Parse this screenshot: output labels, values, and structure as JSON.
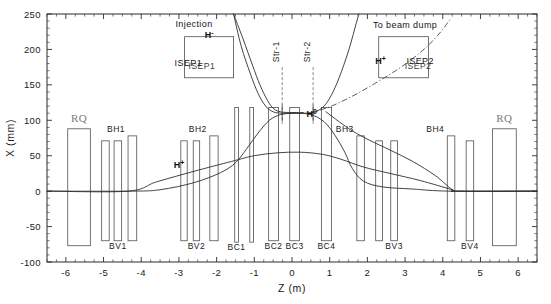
{
  "figure": {
    "background_color": "#ffffff",
    "line_color": "#2f2f2f",
    "magnet_color": "#5a5a5a",
    "rq_label_color": "#7a7a7a"
  },
  "chart_data": {
    "type": "line",
    "title": "",
    "xlabel": "Z (m)",
    "ylabel": "X (mm)",
    "xlim": [
      -6.5,
      6.5
    ],
    "ylim": [
      -100,
      250
    ],
    "xticks": [
      -6,
      -5,
      -4,
      -3,
      -2,
      -1,
      0,
      1,
      2,
      3,
      4,
      5,
      6
    ],
    "xticklabels": [
      "-6",
      "-5",
      "-4",
      "-3",
      "-2",
      "-1",
      "0",
      "1",
      "2",
      "3",
      "4",
      "5",
      "6"
    ],
    "yticks": [
      -100,
      -50,
      0,
      50,
      100,
      150,
      200,
      250
    ],
    "yticklabels": [
      "-100",
      "-50",
      "0",
      "50",
      "100",
      "150",
      "200",
      "250"
    ],
    "x_minor_interval": 0.25,
    "y_minor_interval": 10,
    "grid": false,
    "legend": false,
    "tick_direction": "in",
    "series": [
      {
        "name": "H+ circulating beam",
        "style": "solid",
        "points": [
          [
            -6.5,
            0
          ],
          [
            -4.35,
            0
          ],
          [
            -3.6,
            13
          ],
          [
            -2.6,
            28
          ],
          [
            -1.6,
            42
          ],
          [
            -1.0,
            50
          ],
          [
            -0.4,
            54
          ],
          [
            0.2,
            55
          ],
          [
            0.8,
            52
          ],
          [
            1.3,
            45
          ],
          [
            1.9,
            34
          ],
          [
            2.6,
            25
          ],
          [
            3.4,
            15
          ],
          [
            4.25,
            2
          ],
          [
            4.4,
            0
          ],
          [
            6.5,
            0
          ]
        ]
      },
      {
        "name": "H- injected beam",
        "style": "solid",
        "points": [
          [
            -1.55,
            250
          ],
          [
            -1.3,
            215
          ],
          [
            -1.05,
            178
          ],
          [
            -0.85,
            150
          ],
          [
            -0.65,
            128
          ],
          [
            -0.48,
            116
          ],
          [
            -0.3,
            112
          ],
          [
            -0.1,
            111
          ],
          [
            0.3,
            111
          ]
        ]
      },
      {
        "name": "H- stripped / foil branch",
        "style": "solid",
        "points": [
          [
            -1.55,
            250
          ],
          [
            -1.35,
            205
          ],
          [
            -1.1,
            165
          ],
          [
            -0.9,
            138
          ],
          [
            -0.7,
            120
          ],
          [
            -0.5,
            112
          ],
          [
            -0.28,
            110
          ],
          [
            0.0,
            110
          ],
          [
            0.35,
            110
          ],
          [
            0.62,
            112
          ],
          [
            0.85,
            120
          ],
          [
            1.05,
            136
          ],
          [
            1.25,
            160
          ],
          [
            1.5,
            198
          ],
          [
            1.72,
            240
          ],
          [
            1.78,
            250
          ]
        ]
      },
      {
        "name": "H0 to beam dump (dot-dash)",
        "style": "dashdot",
        "points": [
          [
            0.45,
            110
          ],
          [
            1.0,
            119
          ],
          [
            1.6,
            134
          ],
          [
            2.2,
            152
          ],
          [
            2.75,
            170
          ],
          [
            3.2,
            187
          ],
          [
            3.6,
            205
          ],
          [
            3.95,
            225
          ],
          [
            4.2,
            243
          ]
        ]
      },
      {
        "name": "secondary orbit lower branch",
        "style": "solid",
        "points": [
          [
            -6.5,
            0
          ],
          [
            -4.3,
            0
          ],
          [
            -3.5,
            2
          ],
          [
            -2.6,
            12
          ],
          [
            -1.9,
            26
          ],
          [
            -1.5,
            40
          ],
          [
            -1.2,
            60
          ],
          [
            -0.9,
            82
          ],
          [
            -0.6,
            100
          ],
          [
            -0.3,
            108
          ],
          [
            0.1,
            110
          ],
          [
            0.5,
            108
          ],
          [
            0.85,
            98
          ],
          [
            1.15,
            78
          ],
          [
            1.4,
            55
          ],
          [
            1.6,
            32
          ],
          [
            1.9,
            14
          ],
          [
            2.4,
            6
          ],
          [
            3.2,
            3
          ],
          [
            4.2,
            0
          ],
          [
            6.5,
            0
          ]
        ]
      },
      {
        "name": "extraction branch to right",
        "style": "solid",
        "points": [
          [
            0.9,
            112
          ],
          [
            1.25,
            98
          ],
          [
            1.6,
            85
          ],
          [
            2.05,
            72
          ],
          [
            2.6,
            58
          ],
          [
            3.2,
            42
          ],
          [
            3.8,
            22
          ],
          [
            4.25,
            2
          ],
          [
            4.4,
            0
          ],
          [
            6.5,
            0
          ]
        ]
      }
    ],
    "annotations": [
      {
        "text": "Injection",
        "z": -2.6,
        "x": 232
      },
      {
        "text": "H-",
        "z": -2.2,
        "x": 216
      },
      {
        "text": "ISEP1",
        "z": -2.75,
        "x": 176
      },
      {
        "text": "To beam dump",
        "z": 3.0,
        "x": 230
      },
      {
        "text": "H+",
        "z": 2.35,
        "x": 180
      },
      {
        "text": "ISEP2",
        "z": 3.4,
        "x": 180
      },
      {
        "text": "H+",
        "z": -3.0,
        "x": 33
      },
      {
        "text": "H0",
        "z": 0.52,
        "x": 105
      },
      {
        "text": "Str-1",
        "z": -0.25,
        "x": 150
      },
      {
        "text": "Str-2",
        "z": 0.55,
        "x": 160
      }
    ]
  },
  "axes": {
    "y_axis_label": "X (mm)",
    "x_axis_label": "Z (m)",
    "y_ticklabels": [
      "250",
      "200",
      "150",
      "100",
      "50",
      "0",
      "-50",
      "-100"
    ],
    "x_ticklabels": [
      "-6",
      "-5",
      "-4",
      "-3",
      "-2",
      "-1",
      "0",
      "1",
      "2",
      "3",
      "4",
      "5",
      "6"
    ]
  },
  "magnets": [
    {
      "id": "rq-left",
      "label": "RQ",
      "label_pos": "top",
      "z0": -5.95,
      "z1": -5.35,
      "x0": -77,
      "x1": 88
    },
    {
      "id": "bv1a",
      "label": "",
      "label_pos": "none",
      "z0": -5.05,
      "z1": -4.85,
      "x0": -70,
      "x1": 71
    },
    {
      "id": "bv1b",
      "label": "BV1",
      "label_pos": "bottom",
      "z0": -4.72,
      "z1": -4.52,
      "x0": -70,
      "x1": 71
    },
    {
      "id": "bh1",
      "label": "BH1",
      "label_pos": "top",
      "z0": -4.35,
      "z1": -4.12,
      "x0": -70,
      "x1": 78
    },
    {
      "id": "bv2a",
      "label": "",
      "label_pos": "none",
      "z0": -2.95,
      "z1": -2.78,
      "x0": -70,
      "x1": 71
    },
    {
      "id": "bv2b",
      "label": "BV2",
      "label_pos": "bottom",
      "z0": -2.62,
      "z1": -2.45,
      "x0": -70,
      "x1": 71
    },
    {
      "id": "bh2",
      "label": "BH2",
      "label_pos": "top",
      "z0": -2.18,
      "z1": -1.96,
      "x0": -70,
      "x1": 78
    },
    {
      "id": "bc1",
      "label": "BC1",
      "label_pos": "bottom",
      "z0": -1.52,
      "z1": -1.42,
      "x0": -72,
      "x1": 118
    },
    {
      "id": "bc1b",
      "label": "",
      "label_pos": "none",
      "z0": -1.12,
      "z1": -1.02,
      "x0": -72,
      "x1": 118
    },
    {
      "id": "bc2",
      "label": "BC2",
      "label_pos": "bottom",
      "z0": -0.62,
      "z1": -0.36,
      "x0": -70,
      "x1": 118
    },
    {
      "id": "bc3",
      "label": "BC3",
      "label_pos": "bottom",
      "z0": -0.06,
      "z1": 0.2,
      "x0": -70,
      "x1": 118
    },
    {
      "id": "bc4",
      "label": "BC4",
      "label_pos": "bottom",
      "z0": 0.78,
      "z1": 1.05,
      "x0": -70,
      "x1": 118
    },
    {
      "id": "bh3a",
      "label": "BH3",
      "label_pos": "top",
      "z0": 1.72,
      "z1": 1.92,
      "x0": -70,
      "x1": 78
    },
    {
      "id": "bv3a",
      "label": "",
      "label_pos": "none",
      "z0": 2.22,
      "z1": 2.4,
      "x0": -70,
      "x1": 71
    },
    {
      "id": "bv3b",
      "label": "BV3",
      "label_pos": "bottom",
      "z0": 2.62,
      "z1": 2.8,
      "x0": -70,
      "x1": 71
    },
    {
      "id": "bh4a",
      "label": "BH4",
      "label_pos": "top",
      "z0": 4.12,
      "z1": 4.32,
      "x0": -70,
      "x1": 78
    },
    {
      "id": "bv4",
      "label": "BV4",
      "label_pos": "bottom",
      "z0": 4.62,
      "z1": 4.82,
      "x0": -70,
      "x1": 71
    },
    {
      "id": "rq-right",
      "label": "RQ",
      "label_pos": "top",
      "z0": 5.32,
      "z1": 5.95,
      "x0": -77,
      "x1": 88
    }
  ],
  "septum_boxes": [
    {
      "id": "isep1",
      "label": "ISEP1",
      "z0": -2.85,
      "z1": -1.55,
      "x0": 160,
      "x1": 218
    },
    {
      "id": "isep2",
      "label": "ISEP2",
      "z0": 2.3,
      "z1": 3.62,
      "x0": 160,
      "x1": 218
    }
  ],
  "stripper_markers": [
    {
      "id": "str-1",
      "label": "Str-1",
      "z": -0.26,
      "x_top": 175,
      "x_bot": 95
    },
    {
      "id": "str-2",
      "label": "Str-2",
      "z": 0.56,
      "x_top": 175,
      "x_bot": 95
    }
  ]
}
